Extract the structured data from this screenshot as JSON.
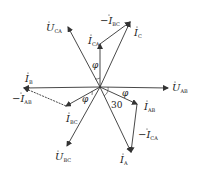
{
  "diagram": {
    "type": "phasor-diagram",
    "origin": [
      100,
      87
    ],
    "voltages": [
      {
        "id": "U_AB",
        "label": "U",
        "sub": "AB",
        "tip": [
          168,
          88
        ],
        "lx": 172,
        "ly": 91
      },
      {
        "id": "U_CA",
        "label": "U",
        "sub": "CA",
        "tip": [
          68,
          27
        ],
        "lx": 46,
        "ly": 31
      },
      {
        "id": "U_BC",
        "label": "U",
        "sub": "BC",
        "tip": [
          67,
          146
        ],
        "lx": 55,
        "ly": 160
      }
    ],
    "currents": [
      {
        "id": "I_C",
        "label": "I",
        "sub": "C",
        "tip": [
          130,
          22
        ],
        "lx": 134,
        "ly": 36
      },
      {
        "id": "I_CA",
        "label": "I",
        "sub": "CA",
        "tip": [
          100,
          44
        ],
        "lx": 88,
        "ly": 44
      },
      {
        "id": "I_B",
        "label": "I",
        "sub": "B",
        "tip": [
          24,
          88
        ],
        "lx": 25,
        "ly": 82
      },
      {
        "id": "I_BC",
        "label": "I",
        "sub": "BC",
        "tip": [
          66,
          106
        ],
        "lx": 66,
        "ly": 122
      },
      {
        "id": "I_AB",
        "label": "I",
        "sub": "AB",
        "tip": [
          137,
          104
        ],
        "lx": 144,
        "ly": 110
      },
      {
        "id": "I_A",
        "label": "I",
        "sub": "A",
        "tip": [
          131,
          152
        ],
        "lx": 120,
        "ly": 163
      }
    ],
    "negatives": [
      {
        "id": "-I_BC",
        "label": "−I",
        "sub": "BC",
        "from": [
          100,
          44
        ],
        "tip": [
          130,
          22
        ],
        "lx": 100,
        "ly": 24
      },
      {
        "id": "-I_AB",
        "label": "−I",
        "sub": "AB",
        "from": [
          66,
          106
        ],
        "tip": [
          24,
          88
        ],
        "lx": 12,
        "ly": 102
      },
      {
        "id": "-I_CA",
        "label": "−I",
        "sub": "CA",
        "from": [
          137,
          104
        ],
        "tip": [
          131,
          152
        ],
        "lx": 138,
        "ly": 138
      }
    ],
    "angles": [
      {
        "label": "φ",
        "x": 92,
        "y": 68
      },
      {
        "label": "φ",
        "x": 122,
        "y": 96
      },
      {
        "label": "φ",
        "x": 82,
        "y": 102
      },
      {
        "label": "30",
        "x": 111,
        "y": 108
      }
    ],
    "stroke_color": "#333333"
  }
}
